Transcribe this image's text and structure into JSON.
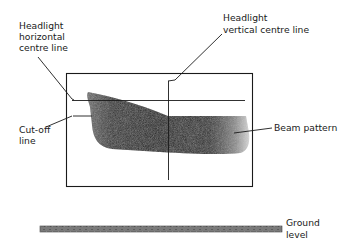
{
  "diagram": {
    "type": "headlight beam alignment",
    "labels": {
      "horizontal_centre_line": [
        "Headlight",
        "horizontal",
        "centre line"
      ],
      "vertical_centre_line": [
        "Headlight",
        "vertical centre line"
      ],
      "cut_off_line": [
        "Cut-off",
        "line"
      ],
      "beam_pattern": [
        "Beam pattern"
      ],
      "ground_level": [
        "Ground",
        "level"
      ]
    },
    "colors": {
      "line": "#1a1a1a",
      "beam_dark": "#111111",
      "beam_light": "#bdbdbd",
      "ground": "#777777"
    }
  }
}
